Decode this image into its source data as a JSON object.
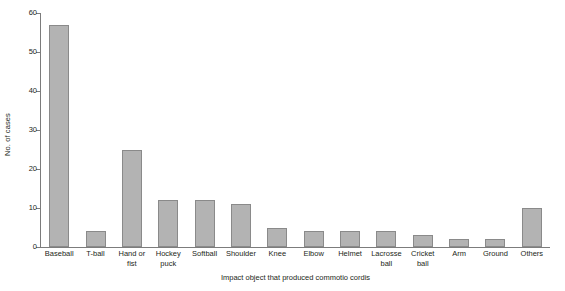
{
  "chart_data": {
    "type": "bar",
    "title": "",
    "xlabel": "Impact object that produced commotio cordis",
    "ylabel": "No. of cases",
    "categories": [
      "Baseball",
      "T-ball",
      "Hand or\nfist",
      "Hockey\npuck",
      "Softball",
      "Shoulder",
      "Knee",
      "Elbow",
      "Helmet",
      "Lacrosse\nball",
      "Cricket\nball",
      "Arm",
      "Ground",
      "Others"
    ],
    "values": [
      57,
      4,
      25,
      12,
      12,
      11,
      5,
      4,
      4,
      4,
      3,
      2,
      2,
      10
    ],
    "ylim": [
      0,
      60
    ],
    "yticks": [
      0,
      10,
      20,
      30,
      40,
      50,
      60
    ],
    "ytick_labels": [
      "0",
      "10",
      "20",
      "30",
      "40",
      "50",
      "60"
    ],
    "grid": false,
    "legend": null,
    "bar_fill_color": "#b3b3b3",
    "bar_border_color": "#8a8a8a",
    "axis_color": "#7c7c7c",
    "text_color": "#231f20",
    "background_color": "#ffffff"
  }
}
